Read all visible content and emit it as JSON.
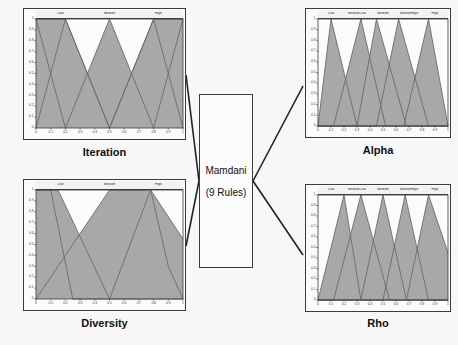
{
  "diagram": {
    "type": "fuzzy-inference-system",
    "background_color": "#f7f7f7",
    "mf_fill_color": "#a8a8a8",
    "mf_line_color": "#6b6b6b",
    "axis_color": "#3b3b3b"
  },
  "engine": {
    "name": "Mamdani",
    "rules_label": "(9 Rules)"
  },
  "axes": {
    "xticks": [
      "0",
      "0.1",
      "0.2",
      "0.3",
      "0.4",
      "0.5",
      "0.6",
      "0.7",
      "0.8",
      "0.9",
      "1"
    ],
    "yticks": [
      "0",
      "0.1",
      "0.2",
      "0.3",
      "0.4",
      "0.5",
      "0.6",
      "0.7",
      "0.8",
      "0.9",
      "1"
    ],
    "xlim": [
      0,
      1
    ],
    "ylim": [
      0,
      1
    ]
  },
  "chart_data": [
    {
      "id": "iteration",
      "type": "line",
      "role": "input",
      "title": "Iteration",
      "xlabel": "",
      "ylabel": "",
      "xlim": [
        0,
        1
      ],
      "ylim": [
        0,
        1
      ],
      "grid": false,
      "legend_position": "top-band",
      "terms": [
        "Low",
        "Medium",
        "High"
      ],
      "series": [
        {
          "name": "Low",
          "x": [
            0,
            0.1,
            0.2,
            0.5,
            0.8,
            0.9,
            1
          ],
          "values": [
            1,
            1,
            1,
            0,
            1,
            1,
            1
          ]
        },
        {
          "name": "Medium",
          "x": [
            0,
            0.2,
            0.5,
            0.8,
            1
          ],
          "values": [
            0,
            1,
            0,
            1,
            0
          ]
        },
        {
          "name": "High",
          "x": [
            0,
            0.2,
            0.5,
            0.8,
            1
          ],
          "values": [
            1,
            0,
            1,
            0,
            1
          ]
        }
      ]
    },
    {
      "id": "diversity",
      "type": "line",
      "role": "input",
      "title": "Diversity",
      "xlabel": "",
      "ylabel": "",
      "xlim": [
        0,
        1
      ],
      "ylim": [
        0,
        1
      ],
      "grid": false,
      "legend_position": "top-band",
      "terms": [
        "Low",
        "Medium",
        "High"
      ],
      "series": [
        {
          "name": "Low",
          "x": [
            0,
            0.1,
            0.25,
            1
          ],
          "values": [
            1,
            1,
            0,
            0
          ]
        },
        {
          "name": "Medium",
          "x": [
            0,
            0.15,
            0.5,
            0.78,
            1
          ],
          "values": [
            1,
            1,
            0,
            1,
            0.55
          ]
        },
        {
          "name": "High",
          "x": [
            0,
            0.5,
            0.78,
            0.9,
            1
          ],
          "values": [
            0,
            1,
            1,
            0.3,
            0
          ]
        }
      ]
    },
    {
      "id": "alpha",
      "type": "line",
      "role": "output",
      "title": "Alpha",
      "xlabel": "",
      "ylabel": "",
      "xlim": [
        0,
        1
      ],
      "ylim": [
        0,
        1
      ],
      "grid": false,
      "legend_position": "top-band",
      "terms": [
        "Low",
        "MediumLow",
        "Medium",
        "MediumHigh",
        "High"
      ],
      "series": [
        {
          "name": "Low",
          "x": [
            0,
            0.1,
            0.3,
            1
          ],
          "values": [
            0,
            1,
            0,
            0
          ]
        },
        {
          "name": "MediumLow",
          "x": [
            0,
            0.12,
            0.33,
            0.52,
            1
          ],
          "values": [
            0,
            0,
            1,
            0,
            0
          ]
        },
        {
          "name": "Medium",
          "x": [
            0,
            0.3,
            0.45,
            0.68,
            1
          ],
          "values": [
            0,
            0,
            1,
            0,
            0
          ]
        },
        {
          "name": "MediumHigh",
          "x": [
            0,
            0.45,
            0.62,
            0.85,
            1
          ],
          "values": [
            0,
            0,
            1,
            0,
            0
          ]
        },
        {
          "name": "High",
          "x": [
            0,
            0.66,
            0.85,
            1
          ],
          "values": [
            0,
            0,
            1,
            0
          ]
        }
      ]
    },
    {
      "id": "rho",
      "type": "line",
      "role": "output",
      "title": "Rho",
      "xlabel": "",
      "ylabel": "",
      "xlim": [
        0,
        1
      ],
      "ylim": [
        0,
        1
      ],
      "grid": false,
      "legend_position": "top-band",
      "terms": [
        "Low",
        "MediumLow",
        "Medium",
        "MediumHigh",
        "High"
      ],
      "series": [
        {
          "name": "Low",
          "x": [
            0,
            0.05,
            0.2,
            0.33,
            1
          ],
          "values": [
            0,
            0.25,
            1,
            0,
            0
          ]
        },
        {
          "name": "MediumLow",
          "x": [
            0,
            0.12,
            0.33,
            0.55,
            1
          ],
          "values": [
            0,
            0,
            1,
            0,
            0
          ]
        },
        {
          "name": "Medium",
          "x": [
            0,
            0.33,
            0.5,
            0.68,
            1
          ],
          "values": [
            0,
            0,
            1,
            0,
            0
          ]
        },
        {
          "name": "MediumHigh",
          "x": [
            0,
            0.5,
            0.67,
            0.85,
            1
          ],
          "values": [
            0,
            0,
            1,
            0,
            0
          ]
        },
        {
          "name": "High",
          "x": [
            0,
            0.68,
            0.85,
            1
          ],
          "values": [
            0,
            0,
            1,
            0.45
          ]
        }
      ]
    }
  ],
  "connectors": [
    {
      "from": "iteration",
      "to": "engine"
    },
    {
      "from": "diversity",
      "to": "engine"
    },
    {
      "from": "engine",
      "to": "alpha"
    },
    {
      "from": "engine",
      "to": "rho"
    }
  ]
}
